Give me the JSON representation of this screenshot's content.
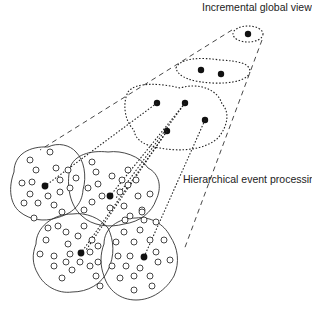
{
  "labels": {
    "top": "Incremental global view",
    "middle": "Hierarchical event processing"
  },
  "colors": {
    "stroke": "#222222",
    "background": "#ffffff"
  },
  "layers": [
    {
      "name": "top",
      "clusters": 1,
      "nodes": [
        [
          248,
          34
        ]
      ]
    },
    {
      "name": "second",
      "clusters": 1,
      "nodes": [
        [
          201,
          70
        ],
        [
          221,
          74
        ]
      ]
    },
    {
      "name": "third",
      "clusters": 1,
      "nodes": [
        [
          157,
          103
        ],
        [
          185,
          103
        ],
        [
          205,
          120
        ],
        [
          167,
          131
        ]
      ]
    },
    {
      "name": "base",
      "clusters": 4,
      "nodes": [
        [
          45,
          186
        ],
        [
          110,
          196
        ],
        [
          81,
          253
        ],
        [
          144,
          257
        ]
      ]
    }
  ]
}
